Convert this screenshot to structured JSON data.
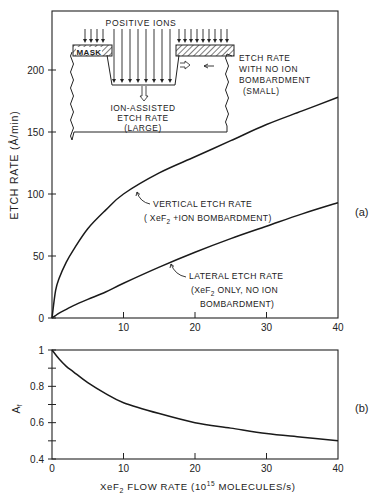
{
  "chart_data": [
    {
      "panel": "(a)",
      "type": "line",
      "title": "",
      "xlabel": "",
      "ylabel": "ETCH RATE (Å/min)",
      "xlim": [
        0,
        40
      ],
      "ylim": [
        0,
        240
      ],
      "xticks": [
        0,
        10,
        20,
        30,
        40
      ],
      "xtick_labels": [
        "",
        "10",
        "20",
        "30",
        "40"
      ],
      "yticks": [
        0,
        50,
        100,
        150,
        200
      ],
      "ytick_labels": [
        "0",
        "50",
        "100",
        "150",
        "200"
      ],
      "grid": false,
      "x": [
        0,
        0.5,
        1,
        2,
        3,
        5,
        7.5,
        10,
        15,
        20,
        25,
        30,
        35,
        40
      ],
      "series": [
        {
          "name": "VERTICAL ETCH RATE (XeF2 + ION BOMBARDMENT)",
          "values": [
            0,
            22,
            32,
            45,
            55,
            72,
            87,
            100,
            117,
            130,
            143,
            156,
            167,
            178
          ]
        },
        {
          "name": "LATERAL ETCH RATE (XeF2 ONLY, NO ION BOMBARDMENT)",
          "values": [
            0,
            2,
            4,
            7,
            10,
            15,
            21,
            28,
            41,
            53,
            64,
            74,
            84,
            93
          ]
        }
      ],
      "annotations": [
        {
          "text_lines": [
            "VERTICAL ETCH RATE",
            "( XeF2 +ION BOMBARDMENT)"
          ],
          "points_to_x": 11.5
        },
        {
          "text_lines": [
            "LATERAL ETCH RATE",
            "(XeF2 ONLY, NO ION",
            "BOMBARDMENT)"
          ],
          "points_to_x": 16.5
        }
      ],
      "inset": {
        "positive_ions_label": "POSITIVE IONS",
        "mask_label": "MASK",
        "ion_assisted_label": [
          "ION-ASSISTED",
          "ETCH RATE",
          "(LARGE)"
        ],
        "no_ion_label": [
          "ETCH RATE",
          "WITH NO ION",
          "BOMBARDMENT",
          "(SMALL)"
        ]
      }
    },
    {
      "panel": "(b)",
      "type": "line",
      "title": "",
      "xlabel": "XeF2 FLOW RATE (10^15 MOLECULES/s)",
      "ylabel": "Af",
      "xlim": [
        0,
        40
      ],
      "ylim": [
        0.4,
        1.0
      ],
      "xticks": [
        0,
        10,
        20,
        30,
        40
      ],
      "xtick_labels": [
        "0",
        "10",
        "20",
        "30",
        "40"
      ],
      "yticks": [
        0.4,
        0.5,
        0.6,
        0.7,
        0.8,
        0.9,
        1.0
      ],
      "ytick_labels": [
        "0.4",
        "",
        "0.6",
        "",
        "0.8",
        "",
        "1"
      ],
      "grid": false,
      "x": [
        0,
        1,
        2,
        3,
        5,
        7.5,
        10,
        15,
        20,
        25,
        30,
        35,
        40
      ],
      "series": [
        {
          "name": "Af",
          "values": [
            1.0,
            0.95,
            0.91,
            0.88,
            0.82,
            0.76,
            0.71,
            0.65,
            0.6,
            0.57,
            0.54,
            0.52,
            0.5
          ]
        }
      ]
    }
  ],
  "labels": {
    "panel_a": "(a)",
    "panel_b": "(b)",
    "top_ylabel": "ETCH RATE (Å/min)",
    "bottom_ylabel_main": "A",
    "bottom_ylabel_sub": "f",
    "xlabel_pre": "XeF",
    "xlabel_sub": "2",
    "xlabel_mid": " FLOW RATE (10",
    "xlabel_sup": "15",
    "xlabel_post": " MOLECULES/s)",
    "vertical_line1": "VERTICAL ETCH RATE",
    "vertical_line2_pre": "( XeF",
    "vertical_line2_sub": "2",
    "vertical_line2_post": " +ION BOMBARDMENT)",
    "lateral_line1": "LATERAL ETCH RATE",
    "lateral_line2_pre": "(XeF",
    "lateral_line2_sub": "2",
    "lateral_line2_post": " ONLY, NO ION",
    "lateral_line3": "BOMBARDMENT)",
    "inset_ions": "POSITIVE IONS",
    "inset_mask": "MASK",
    "inset_ion_assisted_1": "ION-ASSISTED",
    "inset_ion_assisted_2": "ETCH RATE",
    "inset_ion_assisted_3": "(LARGE)",
    "inset_noion_1": "ETCH RATE",
    "inset_noion_2": "WITH NO ION",
    "inset_noion_3": "BOMBARDMENT",
    "inset_noion_4": "(SMALL)"
  },
  "colors": {
    "ink": "#1a1a1a",
    "background": "#ffffff"
  }
}
